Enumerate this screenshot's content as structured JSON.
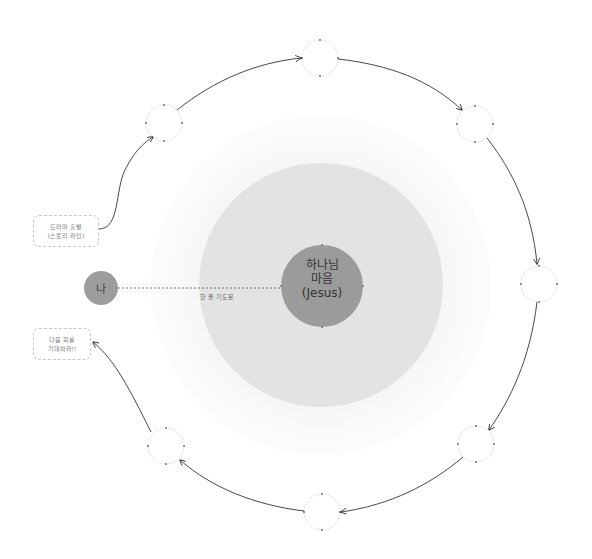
{
  "diagram": {
    "center": {
      "line1": "하나님",
      "line2": "마음",
      "line3": "(Jesus)"
    },
    "me": {
      "label": "나"
    },
    "connector": {
      "label": "한 줄 기도문"
    },
    "start_box": {
      "line1": "드라마 출발",
      "line2": "(스토리 라인)"
    },
    "end_box": {
      "line1": "다음 회를",
      "line2": "기대하라!!"
    },
    "colors": {
      "center_fill": "#9b9b9b",
      "middle_fill": "#e3e3e3",
      "halo_fill": "#f4f4f4",
      "me_fill": "#9d9d9d",
      "arrow": "#333333",
      "node_stroke": "#c8c8c8"
    },
    "orbit_nodes": [
      {
        "cx": 164,
        "cy": 123
      },
      {
        "cx": 320,
        "cy": 58
      },
      {
        "cx": 475,
        "cy": 124
      },
      {
        "cx": 539,
        "cy": 284
      },
      {
        "cx": 476,
        "cy": 444
      },
      {
        "cx": 322,
        "cy": 512
      },
      {
        "cx": 166,
        "cy": 446
      }
    ]
  }
}
